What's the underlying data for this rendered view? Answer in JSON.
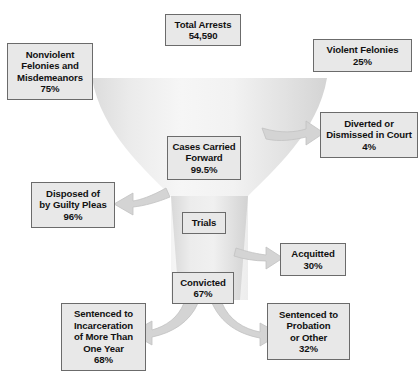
{
  "diagram": {
    "type": "funnel-flow",
    "colors": {
      "box_fill": "#e8e8e8",
      "box_border": "#6b6b6b",
      "funnel_fill_light": "#f2f2f2",
      "funnel_fill_dark": "#d9d9d9",
      "arrow_fill": "#d2d2d2",
      "arrow_border": "#bdbdbd",
      "text": "#111111"
    },
    "nodes": [
      {
        "id": "total-arrests",
        "name": "total-arrests-box",
        "lines": [
          "Total Arrests",
          "54,590"
        ],
        "value": "54,590"
      },
      {
        "id": "nonviolent",
        "name": "nonviolent-felonies-box",
        "lines": [
          "Nonviolent",
          "Felonies and",
          "Misdemeanors",
          "75%"
        ],
        "value": "75%"
      },
      {
        "id": "violent",
        "name": "violent-felonies-box",
        "lines": [
          "Violent Felonies",
          "25%"
        ],
        "value": "25%"
      },
      {
        "id": "diverted",
        "name": "diverted-dismissed-box",
        "lines": [
          "Diverted or",
          "Dismissed in Court",
          "4%"
        ],
        "value": "4%"
      },
      {
        "id": "carried-forward",
        "name": "cases-carried-forward-box",
        "lines": [
          "Cases Carried",
          "Forward",
          "99.5%"
        ],
        "value": "99.5%"
      },
      {
        "id": "guilty-pleas",
        "name": "disposed-guilty-pleas-box",
        "lines": [
          "Disposed of",
          "by Guilty Pleas",
          "96%"
        ],
        "value": "96%"
      },
      {
        "id": "trials",
        "name": "trials-box",
        "lines": [
          "Trials"
        ],
        "value": ""
      },
      {
        "id": "acquitted",
        "name": "acquitted-box",
        "lines": [
          "Acquitted",
          "30%"
        ],
        "value": "30%"
      },
      {
        "id": "convicted",
        "name": "convicted-box",
        "lines": [
          "Convicted",
          "67%"
        ],
        "value": "67%"
      },
      {
        "id": "incarceration",
        "name": "sentenced-incarceration-box",
        "lines": [
          "Sentenced to",
          "Incarceration",
          "of More Than",
          "One Year",
          "68%"
        ],
        "value": "68%"
      },
      {
        "id": "probation",
        "name": "sentenced-probation-box",
        "lines": [
          "Sentenced to",
          "Probation",
          "or Other",
          "32%"
        ],
        "value": "32%"
      }
    ]
  }
}
